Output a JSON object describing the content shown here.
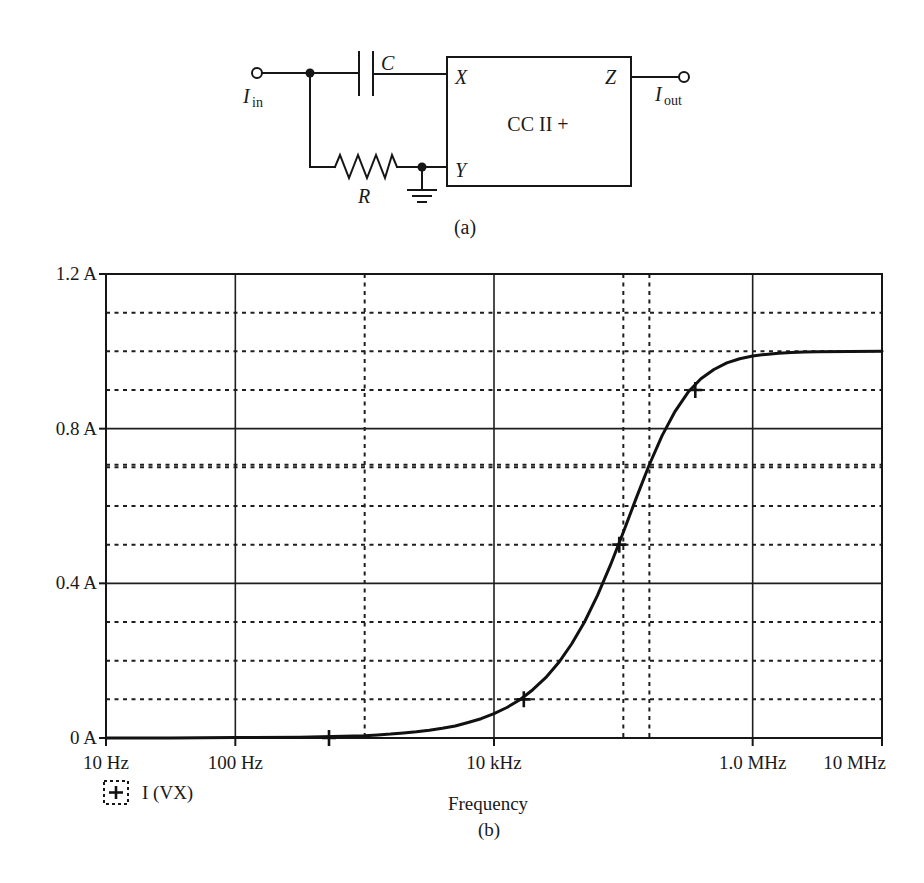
{
  "figure": {
    "circuit": {
      "capacitor_label": "C",
      "resistor_label": "R",
      "block_label": "CC II +",
      "port_x": "X",
      "port_y": "Y",
      "port_z": "Z",
      "input": {
        "symbol": "I",
        "subscript": "in"
      },
      "output": {
        "symbol": "I",
        "subscript": "out"
      },
      "caption": "(a)"
    },
    "plot_caption": "(b)"
  },
  "chart_data": {
    "type": "line",
    "title": "",
    "xlabel": "Frequency",
    "ylabel": "",
    "xscale": "log",
    "xlim": [
      10,
      10000000
    ],
    "ylim": [
      0,
      1.2
    ],
    "x_ticks": [
      {
        "value": 10,
        "label": "10 Hz"
      },
      {
        "value": 100,
        "label": "100 Hz"
      },
      {
        "value": 10000,
        "label": "10 kHz"
      },
      {
        "value": 1000000,
        "label": "1.0 MHz"
      },
      {
        "value": 10000000,
        "label": "10 MHz"
      }
    ],
    "y_ticks": [
      {
        "value": 0,
        "label": "0 A"
      },
      {
        "value": 0.4,
        "label": "0.4 A"
      },
      {
        "value": 0.8,
        "label": "0.8 A"
      },
      {
        "value": 1.2,
        "label": "1.2 A"
      }
    ],
    "grid": {
      "on": true,
      "x_major": [
        100,
        10000,
        1000000
      ],
      "x_minor": [
        1000,
        100000
      ],
      "y_major": [
        0.4,
        0.8
      ],
      "y_minor": [
        0,
        0.1,
        0.2,
        0.3,
        0.5,
        0.6,
        0.7,
        0.9,
        1.0,
        1.1
      ]
    },
    "cursor": {
      "x": 159000,
      "y": 0.707
    },
    "legend": {
      "position": "bottom-left",
      "symbol": "+"
    },
    "series": [
      {
        "name": "I (VX)",
        "x": [
          10,
          31.6,
          100,
          316,
          1000,
          1259,
          1585,
          1995,
          2512,
          3162,
          3981,
          5012,
          6310,
          7943,
          10000,
          12589,
          15849,
          19953,
          25119,
          31623,
          39811,
          50119,
          63096,
          79433,
          100000,
          125893,
          158489,
          199526,
          251189,
          316228,
          398107,
          501187,
          630957,
          794328,
          1000000,
          1258925,
          1584893,
          1995262,
          2511886,
          3162278,
          10000000
        ],
        "y": [
          0.0,
          0.0,
          0.001,
          0.002,
          0.006,
          0.008,
          0.01,
          0.013,
          0.016,
          0.02,
          0.025,
          0.031,
          0.04,
          0.05,
          0.063,
          0.079,
          0.099,
          0.125,
          0.156,
          0.195,
          0.243,
          0.3,
          0.369,
          0.447,
          0.532,
          0.621,
          0.706,
          0.782,
          0.845,
          0.894,
          0.929,
          0.953,
          0.97,
          0.981,
          0.988,
          0.992,
          0.995,
          0.997,
          0.998,
          0.999,
          1.0
        ],
        "markers": {
          "x": [
            530,
            17000,
            93000,
            360000
          ],
          "y": [
            0.0,
            0.1,
            0.5,
            0.9
          ]
        }
      }
    ]
  }
}
